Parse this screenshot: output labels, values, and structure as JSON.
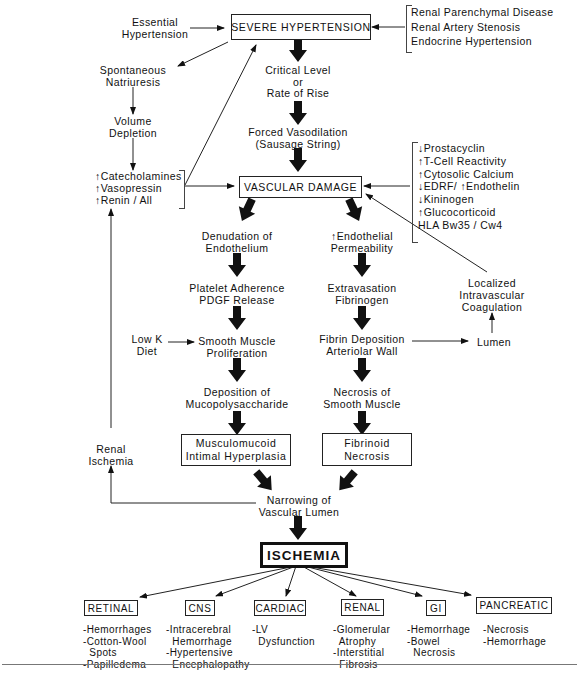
{
  "top": {
    "severe_hypertension": "SEVERE HYPERTENSION",
    "essential_hypertension": "Essential\nHypertension",
    "secondary_causes": [
      "Renal Parenchymal Disease",
      "Renal Artery Stenosis",
      "Endocrine Hypertension"
    ],
    "critical_level": "Critical Level\nor\nRate of Rise",
    "forced_vasodilation": "Forced Vasodilation\n(Sausage String)"
  },
  "left_loop": {
    "spontaneous_natriuresis": "Spontaneous\nNatriuresis",
    "volume_depletion": "Volume\nDepletion",
    "hormones": [
      "↑Catecholamines",
      "↑Vasopressin",
      "↑Renin / All"
    ],
    "renal_ischemia": "Renal\nIschemia"
  },
  "vascular_damage": {
    "label": "VASCULAR DAMAGE",
    "factors": [
      "↓Prostacyclin",
      "↑T-Cell Reactivity",
      "↑Cytosolic Calcium",
      "↓EDRF/ ↑Endothelin",
      "↓Kininogen",
      "↑Glucocorticoid",
      "HLA Bw35 / Cw4"
    ]
  },
  "left_branch": {
    "denudation": "Denudation of\nEndothelium",
    "platelet": "Platelet Adherence\nPDGF Release",
    "low_k": "Low K\nDiet",
    "smooth_muscle_prolif": "Smooth Muscle\nProliferation",
    "mucopoly": "Deposition of\nMucopolysaccharide",
    "result_box": "Musculomucoid\nIntimal Hyperplasia"
  },
  "right_branch": {
    "permeability": "↑Endothelial\nPermeability",
    "extravasation": "Extravasation\nFibrinogen",
    "fibrin_deposition": "Fibrin Deposition\nArteriolar Wall",
    "lumen": "Lumen",
    "localized_coag": "Localized\nIntravascular\nCoagulation",
    "necrosis_sm": "Necrosis of\nSmooth Muscle",
    "result_box": "Fibrinoid\nNecrosis"
  },
  "bottom": {
    "narrowing": "Narrowing of\nVascular Lumen",
    "ischemia": "ISCHEMIA",
    "organs": [
      {
        "name": "RETINAL",
        "effects": [
          "-Hemorrhages",
          "-Cotton-Wool",
          "  Spots",
          "-Papilledema"
        ]
      },
      {
        "name": "CNS",
        "effects": [
          "-Intracerebral",
          "  Hemorrhage",
          "-Hypertensive",
          "  Encephalopathy"
        ]
      },
      {
        "name": "CARDIAC",
        "effects": [
          "-LV",
          "  Dysfunction"
        ]
      },
      {
        "name": "RENAL",
        "effects": [
          "-Glomerular",
          "  Atrophy",
          "-Interstitial",
          "  Fibrosis"
        ]
      },
      {
        "name": "GI",
        "effects": [
          "-Hemorrhage",
          "-Bowel",
          "  Necrosis"
        ]
      },
      {
        "name": "PANCREATIC",
        "effects": [
          "-Necrosis",
          "-Hemorrhage"
        ]
      }
    ]
  }
}
